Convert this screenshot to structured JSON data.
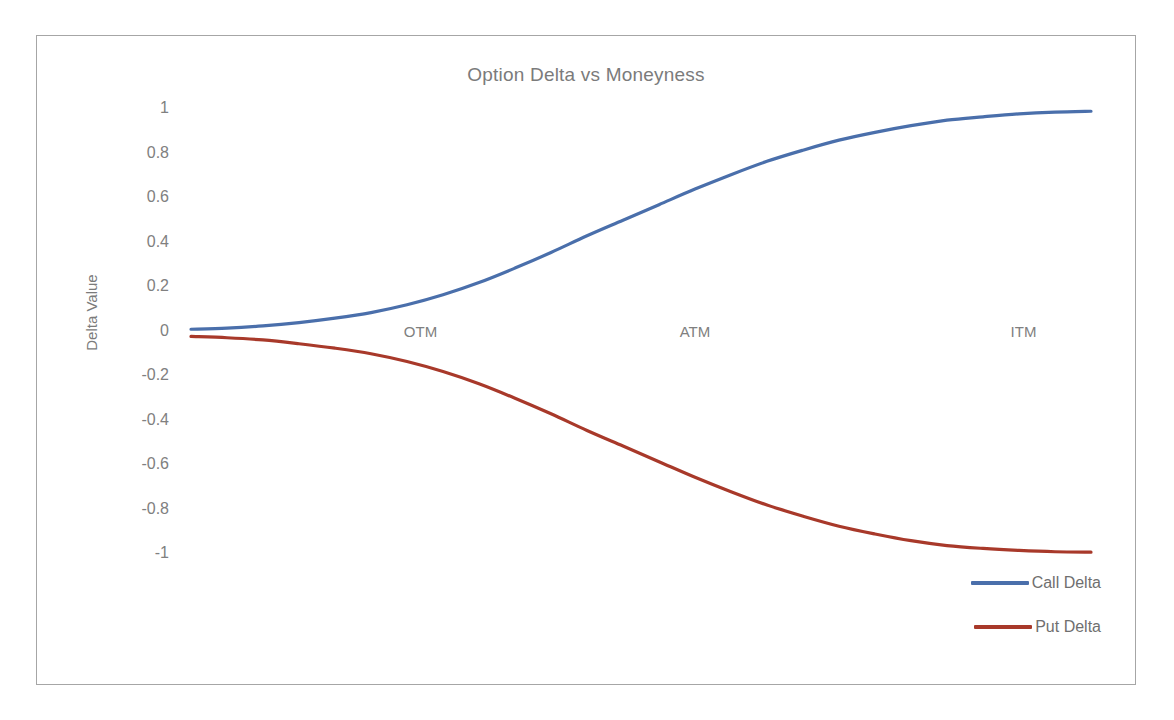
{
  "chart_data": {
    "type": "line",
    "title": "Option Delta vs Moneyness",
    "xlabel": "",
    "ylabel": "Delta Value",
    "ylim": [
      -1,
      1
    ],
    "yticks": [
      "1",
      "0.8",
      "0.6",
      "0.4",
      "0.2",
      "0",
      "-0.2",
      "-0.4",
      "-0.6",
      "-0.8",
      "-1"
    ],
    "ytick_values": [
      1,
      0.8,
      0.6,
      0.4,
      0.2,
      0,
      -0.2,
      -0.4,
      -0.6,
      -0.8,
      -1
    ],
    "grid": false,
    "legend_position": "bottom-right",
    "x": [
      0,
      0.04,
      0.08,
      0.12,
      0.16,
      0.2,
      0.24,
      0.28,
      0.32,
      0.36,
      0.4,
      0.44,
      0.48,
      0.52,
      0.56,
      0.6,
      0.64,
      0.68,
      0.72,
      0.76,
      0.8,
      0.84,
      0.88,
      0.92,
      0.96,
      1
    ],
    "series": [
      {
        "name": "Call Delta",
        "color": "#4a6fab",
        "values": [
          0.01,
          0.015,
          0.025,
          0.04,
          0.06,
          0.085,
          0.12,
          0.165,
          0.22,
          0.285,
          0.355,
          0.43,
          0.5,
          0.57,
          0.64,
          0.705,
          0.765,
          0.815,
          0.86,
          0.895,
          0.925,
          0.95,
          0.965,
          0.978,
          0.986,
          0.99
        ]
      },
      {
        "name": "Put Delta",
        "color": "#a8392a",
        "values": [
          -0.022,
          -0.028,
          -0.038,
          -0.055,
          -0.075,
          -0.1,
          -0.135,
          -0.18,
          -0.235,
          -0.3,
          -0.37,
          -0.445,
          -0.515,
          -0.585,
          -0.655,
          -0.72,
          -0.78,
          -0.83,
          -0.875,
          -0.91,
          -0.94,
          -0.962,
          -0.975,
          -0.984,
          -0.99,
          -0.992
        ]
      }
    ],
    "annotations": [
      {
        "text": "OTM",
        "x": 0.255,
        "y": 0.0
      },
      {
        "text": "ATM",
        "x": 0.56,
        "y": 0.0
      },
      {
        "text": "ITM",
        "x": 0.925,
        "y": 0.0
      }
    ]
  },
  "legend": {
    "items": [
      {
        "label": "Call Delta",
        "color": "#4a6fab"
      },
      {
        "label": "Put Delta",
        "color": "#a8392a"
      }
    ]
  },
  "colors": {
    "call": "#4a6fab",
    "put": "#a8392a",
    "text": "#7b7b7b",
    "border": "#a6a6a6",
    "background": "#ffffff"
  }
}
